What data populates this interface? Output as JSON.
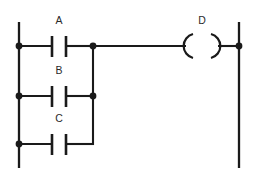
{
  "diagram": {
    "type": "ladder-logic",
    "title": "",
    "colors": {
      "line": "#1a1a1a",
      "background": "#ffffff",
      "label": "#2a2a2a"
    },
    "rails": {
      "left": {
        "x": 19,
        "y_top": 22,
        "y_bottom": 168
      },
      "right": {
        "x": 239,
        "y_top": 22,
        "y_bottom": 168
      }
    },
    "branch": {
      "x": 93,
      "y_top": 46,
      "y_bottom": 144
    },
    "contacts": [
      {
        "label": "A",
        "kind": "normally-open-contact",
        "row_y": 46,
        "label_x": 59,
        "label_y": 24,
        "bar_left_x": 52,
        "bar_right_x": 66,
        "bar_y_top": 36,
        "bar_y_bottom": 57,
        "wire_start_x": 19,
        "wire_end_x": 93
      },
      {
        "label": "B",
        "kind": "normally-open-contact",
        "row_y": 96,
        "label_x": 59,
        "label_y": 74,
        "bar_left_x": 52,
        "bar_right_x": 66,
        "bar_y_top": 86,
        "bar_y_bottom": 107,
        "wire_start_x": 19,
        "wire_end_x": 93
      },
      {
        "label": "C",
        "kind": "normally-open-contact",
        "row_y": 144,
        "label_x": 59,
        "label_y": 122,
        "bar_left_x": 52,
        "bar_right_x": 66,
        "bar_y_top": 134,
        "bar_y_bottom": 155,
        "wire_start_x": 19,
        "wire_end_x": 93
      }
    ],
    "coil": {
      "label": "D",
      "kind": "output-coil",
      "row_y": 46,
      "label_x": 202,
      "label_y": 24,
      "left_arc_x": 192,
      "right_arc_x": 212,
      "arc_radius": 12,
      "wire_in_start_x": 93,
      "wire_in_end_x": 186,
      "wire_out_start_x": 218,
      "wire_out_end_x": 239
    },
    "nodes": [
      {
        "name": "left-rail-node-a",
        "x": 19,
        "y": 46,
        "r": 3.4
      },
      {
        "name": "left-rail-node-b",
        "x": 19,
        "y": 96,
        "r": 3.4
      },
      {
        "name": "left-rail-node-c",
        "x": 19,
        "y": 144,
        "r": 3.4
      },
      {
        "name": "branch-node-a",
        "x": 93,
        "y": 46,
        "r": 3.4
      },
      {
        "name": "branch-node-b",
        "x": 93,
        "y": 96,
        "r": 3.4
      },
      {
        "name": "right-rail-node-d",
        "x": 239,
        "y": 46,
        "r": 3.4
      }
    ]
  }
}
